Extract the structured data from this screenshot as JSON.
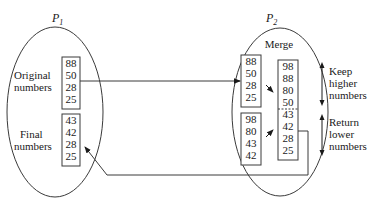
{
  "diagram": {
    "p1": {
      "label": "P",
      "subscript": "1",
      "original": {
        "label_line1": "Original",
        "label_line2": "numbers",
        "values": [
          "88",
          "50",
          "28",
          "25"
        ]
      },
      "final": {
        "label_line1": "Final",
        "label_line2": "numbers",
        "values": [
          "43",
          "42",
          "28",
          "25"
        ]
      }
    },
    "p2": {
      "label": "P",
      "subscript": "2",
      "title": "Merge",
      "incoming": {
        "values": [
          "88",
          "50",
          "28",
          "25"
        ]
      },
      "own": {
        "values": [
          "98",
          "80",
          "43",
          "42"
        ]
      },
      "merged": {
        "values": [
          "98",
          "88",
          "80",
          "50",
          "43",
          "42",
          "28",
          "25"
        ]
      }
    },
    "annotations": {
      "keep": {
        "line1": "Keep",
        "line2": "higher",
        "line3": "numbers"
      },
      "return": {
        "line1": "Return",
        "line2": "lower",
        "line3": "numbers"
      }
    },
    "colors": {
      "line": "#3a3a3a",
      "text": "#1a1a1a",
      "background": "#ffffff"
    }
  }
}
